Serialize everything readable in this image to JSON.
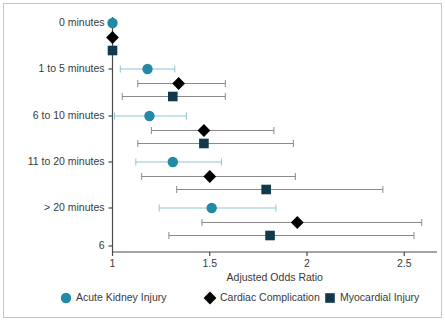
{
  "figure": {
    "border_color": "#b4ccd6",
    "background": "#ffffff"
  },
  "chart_data": {
    "type": "scatter",
    "subtype": "forest-plot",
    "title": "",
    "xlabel": "Adjusted Odds Ratio",
    "ylabel": "",
    "xlim": [
      0.93,
      2.72
    ],
    "xticks": [
      1,
      1.5,
      2,
      2.5
    ],
    "xtick_labels": [
      "1",
      "1.5",
      "2",
      "2.5"
    ],
    "ytick_labels": [
      "0 minutes",
      "1 to 5 minutes",
      "6 to 10 minutes",
      "11 to 20 minutes",
      "> 20 minutes",
      "6"
    ],
    "grid": false,
    "legend_position": "bottom",
    "categories": [
      "0 minutes",
      "1 to 5 minutes",
      "6 to 10 minutes",
      "11 to 20 minutes",
      "> 20 minutes"
    ],
    "series": [
      {
        "name": "Acute Kidney Injury",
        "marker": "circle",
        "color": "#2389a6",
        "line_color": "#8ec4d4",
        "values": [
          1.0,
          1.18,
          1.19,
          1.31,
          1.51
        ],
        "ci_low": [
          null,
          1.04,
          1.01,
          1.12,
          1.24
        ],
        "ci_high": [
          null,
          1.32,
          1.38,
          1.56,
          1.84
        ]
      },
      {
        "name": "Cardiac Complication",
        "marker": "diamond",
        "color": "#000000",
        "line_color": "#8a8a8a",
        "values": [
          1.0,
          1.34,
          1.47,
          1.5,
          1.95
        ],
        "ci_low": [
          null,
          1.13,
          1.2,
          1.15,
          1.46
        ],
        "ci_high": [
          null,
          1.58,
          1.83,
          1.94,
          2.59
        ]
      },
      {
        "name": "Myocardial Injury",
        "marker": "square",
        "color": "#10394b",
        "line_color": "#8a8a8a",
        "values": [
          1.0,
          1.31,
          1.47,
          1.79,
          1.81
        ],
        "ci_low": [
          null,
          1.05,
          1.13,
          1.33,
          1.29
        ],
        "ci_high": [
          null,
          1.58,
          1.93,
          2.39,
          2.55
        ]
      }
    ],
    "legend": [
      {
        "label": "Acute Kidney Injury",
        "marker": "circle",
        "color": "#2389a6"
      },
      {
        "label": "Cardiac Complication",
        "marker": "diamond",
        "color": "#000000"
      },
      {
        "label": "Myocardial Injury",
        "marker": "square",
        "color": "#10394b"
      }
    ]
  }
}
